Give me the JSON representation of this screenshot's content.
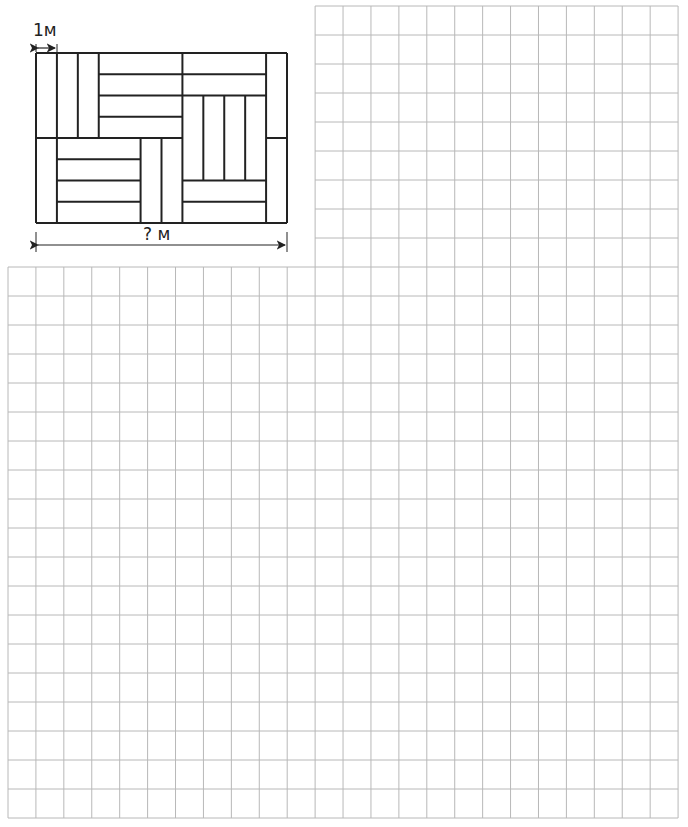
{
  "diagram": {
    "unit_label": "1м",
    "total_label": "? м",
    "units_wide": 12,
    "units_high": 8,
    "segments": [
      [
        0,
        0,
        12,
        0
      ],
      [
        0,
        8,
        12,
        8
      ],
      [
        0,
        0,
        0,
        8
      ],
      [
        12,
        0,
        12,
        8
      ],
      [
        0,
        4,
        1,
        4
      ],
      [
        11,
        4,
        12,
        4
      ],
      [
        1,
        0,
        1,
        8
      ],
      [
        2,
        0,
        2,
        4
      ],
      [
        3,
        0,
        3,
        4
      ],
      [
        3,
        1,
        11,
        1
      ],
      [
        3,
        2,
        11,
        2
      ],
      [
        3,
        3,
        7,
        3
      ],
      [
        1,
        4,
        7,
        4
      ],
      [
        7,
        0,
        7,
        8
      ],
      [
        11,
        0,
        11,
        8
      ],
      [
        8,
        2,
        8,
        6
      ],
      [
        9,
        2,
        9,
        6
      ],
      [
        10,
        2,
        10,
        6
      ],
      [
        7,
        6,
        11,
        6
      ],
      [
        7,
        7,
        11,
        7
      ],
      [
        1,
        5,
        5,
        5
      ],
      [
        1,
        6,
        5,
        6
      ],
      [
        1,
        7,
        5,
        7
      ],
      [
        5,
        4,
        5,
        8
      ],
      [
        6,
        4,
        6,
        8
      ]
    ]
  },
  "grid": {
    "line_color": "#b8b8b8",
    "cell_w": 27.92,
    "cell_h": 29,
    "left": 8,
    "top_section": {
      "start_col": 11,
      "cols": 13,
      "rows": 9,
      "top": 6
    },
    "bottom_section": {
      "cols": 24,
      "rows": 19,
      "top": 267
    }
  }
}
